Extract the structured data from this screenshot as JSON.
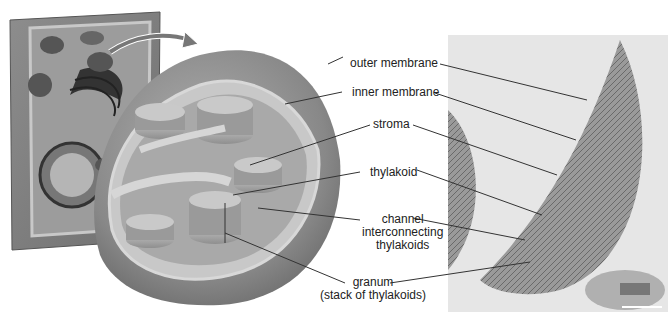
{
  "diagram": {
    "labels": [
      {
        "id": "outer-membrane",
        "text": "outer membrane"
      },
      {
        "id": "inner-membrane",
        "text": "inner membrane"
      },
      {
        "id": "stroma",
        "text": "stroma"
      },
      {
        "id": "thylakoid",
        "text": "thylakoid"
      },
      {
        "id": "channel",
        "lines": [
          "channel",
          "interconnecting",
          "thylakoids"
        ]
      },
      {
        "id": "granum",
        "lines": [
          "granum",
          "(stack of thylakoids)"
        ]
      }
    ],
    "panels": {
      "cell": "plant cell illustration with arrow pointing to chloroplast",
      "cutaway": "3D cutaway illustration of chloroplast",
      "micrograph": "electron micrograph of chloroplast with scale bar"
    },
    "colors": {
      "background": "#ffffff",
      "text": "#222222",
      "leader_line": "#333333",
      "outer_shell": "#8a8a8a",
      "grana": "#a8a8a8",
      "micrograph_bg": "#e6e6e6"
    }
  }
}
